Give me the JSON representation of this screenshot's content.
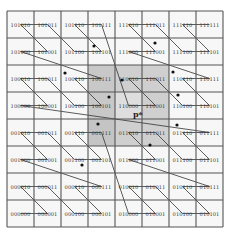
{
  "diagram": {
    "grid": {
      "rows": 8,
      "cols": 8,
      "x0": 7,
      "y0": 11,
      "cell": 27
    },
    "rows": [
      [
        "101010",
        "101011",
        "101110",
        "101111",
        "111010",
        "111011",
        "111110",
        "111111"
      ],
      [
        "101000",
        "101001",
        "101100",
        "101101",
        "111000",
        "111001",
        "111100",
        "111101"
      ],
      [
        "100010",
        "100011",
        "100110",
        "100111",
        "110010",
        "110011",
        "110110",
        "110111"
      ],
      [
        "100000",
        "100001",
        "100100",
        "100101",
        "110000",
        "110001",
        "110100",
        "110101"
      ],
      [
        "001010",
        "001011",
        "001110",
        "001111",
        "011010",
        "011011",
        "011110",
        "011111"
      ],
      [
        "001000",
        "001001",
        "001100",
        "001101",
        "011000",
        "011001",
        "011100",
        "011101"
      ],
      [
        "000010",
        "000011",
        "000110",
        "000111",
        "010010",
        "010011",
        "010110",
        "010111"
      ],
      [
        "000000",
        "000001",
        "000100",
        "000101",
        "010000",
        "010001",
        "010100",
        "010101"
      ]
    ],
    "shaded_cells": [
      {
        "row": 2,
        "col": 3,
        "shade": "#c8c8c8"
      },
      {
        "row": 2,
        "col": 4,
        "shade": "#cfcfcf"
      },
      {
        "row": 2,
        "col": 5,
        "shade": "#cfcfcf"
      },
      {
        "row": 3,
        "col": 3,
        "shade": "#c8c8c8"
      },
      {
        "row": 3,
        "col": 4,
        "shade": "#dedede"
      },
      {
        "row": 3,
        "col": 5,
        "shade": "#cfcfcf"
      },
      {
        "row": 4,
        "col": 3,
        "shade": "#c4c4c4"
      },
      {
        "row": 4,
        "col": 4,
        "shade": "#cfcfcf"
      },
      {
        "row": 4,
        "col": 5,
        "shade": "#cfcfcf"
      }
    ],
    "query_point": {
      "label": "p*",
      "x": 133,
      "y": 117
    },
    "points": [
      {
        "x": 94,
        "y": 46
      },
      {
        "x": 155,
        "y": 43
      },
      {
        "x": 65,
        "y": 73
      },
      {
        "x": 122,
        "y": 80
      },
      {
        "x": 173,
        "y": 72
      },
      {
        "x": 109,
        "y": 97
      },
      {
        "x": 177,
        "y": 125
      },
      {
        "x": 98,
        "y": 124
      },
      {
        "x": 82,
        "y": 165
      },
      {
        "x": 150,
        "y": 145
      },
      {
        "x": 178,
        "y": 95
      }
    ],
    "colors": {
      "grid": "#555555",
      "curve": "#333333",
      "background": "#f7f7f7",
      "point": "#111111"
    }
  }
}
